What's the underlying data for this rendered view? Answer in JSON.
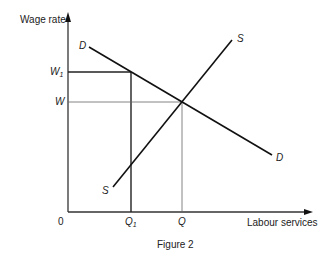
{
  "figure": {
    "caption": "Figure 2",
    "y_axis_label": "Wage rate",
    "x_axis_label": "Labour services",
    "origin_label": "0",
    "y_ticks": [
      {
        "base": "W",
        "sub": "1"
      },
      {
        "base": "W",
        "sub": ""
      }
    ],
    "x_ticks": [
      {
        "base": "Q",
        "sub": "1"
      },
      {
        "base": "Q",
        "sub": ""
      }
    ],
    "curves": {
      "demand": {
        "start_label": "D",
        "end_label": "D"
      },
      "supply": {
        "start_label": "S",
        "end_label": "S"
      }
    },
    "colors": {
      "line": "#1a1a1a",
      "guide": "#555555",
      "background": "#ffffff"
    }
  }
}
